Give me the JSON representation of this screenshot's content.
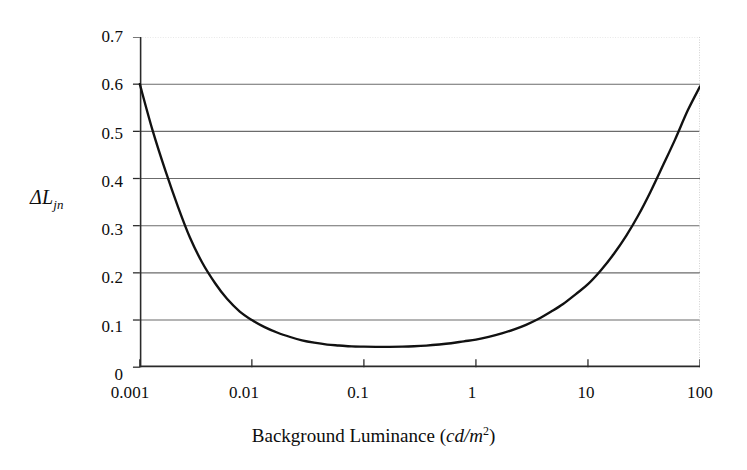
{
  "chart_data": {
    "type": "line",
    "title": "",
    "subtitle": "",
    "xlabel_parts": {
      "main": "Background Luminance",
      "open_paren": "(",
      "unit": "cd/m",
      "exponent": "2",
      "close_paren": ")"
    },
    "xlabel": "Background Luminance (cd/m2)",
    "ylabel_parts": {
      "delta": "Δ",
      "symbol": "L",
      "subscript": "jn"
    },
    "ylabel": "ΔLjn",
    "xscale": "log",
    "yscale": "linear",
    "xlim": [
      0.001,
      100
    ],
    "ylim": [
      0,
      0.7
    ],
    "xticks": [
      0.001,
      0.01,
      0.1,
      1,
      10,
      100
    ],
    "xtick_labels": [
      "0.001",
      "0.01",
      "0.1",
      "1",
      "10",
      "100"
    ],
    "yticks": [
      0,
      0.1,
      0.2,
      0.3,
      0.4,
      0.5,
      0.6,
      0.7
    ],
    "ytick_labels": [
      "0",
      "0.1",
      "0.2",
      "0.3",
      "0.4",
      "0.5",
      "0.6",
      "0.7"
    ],
    "grid": "horizontal",
    "grid_color": "#6b6b6b",
    "top_grid_color": "#cfcfcf",
    "legend": "none",
    "line_color": "#111111",
    "line_width": 2.4,
    "annotations": [],
    "series": [
      {
        "name": "JND threshold",
        "x": [
          0.001,
          0.0013,
          0.0017,
          0.0022,
          0.0028,
          0.0036,
          0.0047,
          0.006,
          0.0078,
          0.01,
          0.013,
          0.017,
          0.022,
          0.028,
          0.036,
          0.047,
          0.06,
          0.078,
          0.1,
          0.13,
          0.17,
          0.22,
          0.28,
          0.36,
          0.47,
          0.6,
          0.78,
          1,
          1.3,
          1.7,
          2.2,
          2.8,
          3.6,
          4.7,
          6,
          7.8,
          10,
          13,
          17,
          22,
          28,
          36,
          47,
          60,
          78,
          100
        ],
        "y": [
          0.6,
          0.502,
          0.415,
          0.339,
          0.275,
          0.222,
          0.178,
          0.145,
          0.118,
          0.1,
          0.085,
          0.073,
          0.064,
          0.057,
          0.052,
          0.048,
          0.046,
          0.044,
          0.0435,
          0.0432,
          0.0432,
          0.0436,
          0.0444,
          0.0458,
          0.0481,
          0.0508,
          0.0548,
          0.0585,
          0.0642,
          0.0715,
          0.0802,
          0.0898,
          0.102,
          0.118,
          0.134,
          0.155,
          0.176,
          0.205,
          0.24,
          0.279,
          0.321,
          0.371,
          0.429,
          0.483,
          0.545,
          0.595
        ]
      }
    ],
    "minimum": {
      "x": 0.16,
      "y": 0.043
    },
    "endpoints": {
      "left": {
        "x": 0.001,
        "y": 0.6
      },
      "right": {
        "x": 100,
        "y": 0.595
      }
    }
  },
  "figure": {
    "background": "#ffffff",
    "axis_color": "#2a2a2a"
  }
}
